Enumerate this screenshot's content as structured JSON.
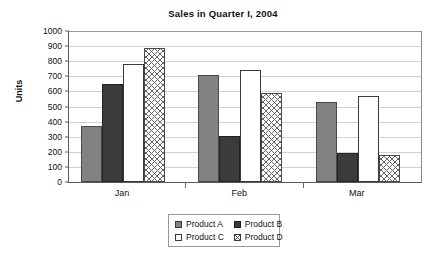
{
  "chart_data": {
    "type": "bar",
    "title": "Sales in Quarter I, 2004",
    "xlabel": "",
    "ylabel": "Units",
    "categories": [
      "Jan",
      "Feb",
      "Mar"
    ],
    "series": [
      {
        "name": "Product A",
        "values": [
          370,
          710,
          530
        ],
        "swatch": "solid-gray"
      },
      {
        "name": "Product B",
        "values": [
          650,
          305,
          190
        ],
        "swatch": "solid-dark"
      },
      {
        "name": "Product C",
        "values": [
          780,
          740,
          570
        ],
        "swatch": "solid-white"
      },
      {
        "name": "Product D",
        "values": [
          890,
          590,
          180
        ],
        "swatch": "crosshatch"
      }
    ],
    "ylim": [
      0,
      1000
    ],
    "ytick_step": 100,
    "yticks": [
      0,
      100,
      200,
      300,
      400,
      500,
      600,
      700,
      800,
      900,
      1000
    ],
    "ytick_labels": [
      "0",
      "100",
      "200",
      "300",
      "400",
      "500",
      "600",
      "700",
      "800",
      "900",
      "1000"
    ],
    "grid": true,
    "grid_axis": "y",
    "legend_position": "bottom-center",
    "colors": {
      "product_a": "#828282",
      "product_b": "#3b3b3b",
      "product_c": "#ffffff",
      "product_d": "#ffffff",
      "gridline": "#d2d2d2",
      "axis": "#5a5a5a",
      "text": "#111111",
      "background": "#ffffff"
    }
  }
}
